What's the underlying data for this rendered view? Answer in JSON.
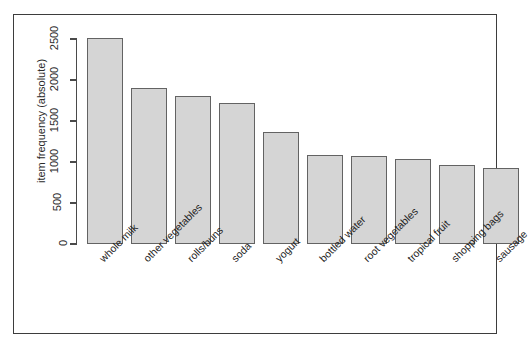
{
  "figure": {
    "frame_border_color": "#3d3d3d",
    "background": "#ffffff",
    "cropped_header_text": ""
  },
  "axis": {
    "y_label": "item frequency (absolute)",
    "y_ticks": [
      "0",
      "500",
      "1000",
      "1500",
      "2000",
      "2500"
    ]
  },
  "chart_data": {
    "type": "bar",
    "title": "",
    "xlabel": "",
    "ylabel": "item frequency (absolute)",
    "ylim": [
      0,
      2500
    ],
    "grid": false,
    "legend": false,
    "bar_fill_color": "#d5d5d5",
    "bar_border_color": "#636363",
    "categories": [
      "whole milk",
      "other vegetables",
      "rolls/buns",
      "soda",
      "yogurt",
      "bottled water",
      "root vegetables",
      "tropical fruit",
      "shopping bags",
      "sausage"
    ],
    "values": [
      2513,
      1903,
      1809,
      1715,
      1372,
      1087,
      1072,
      1032,
      969,
      924
    ]
  }
}
